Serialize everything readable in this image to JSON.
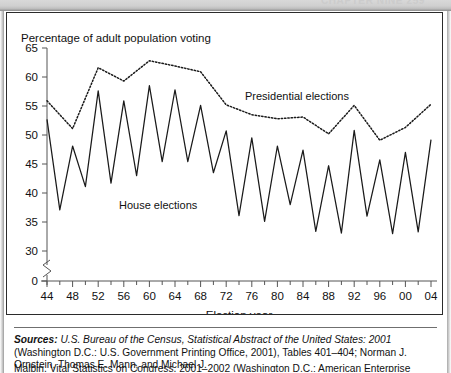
{
  "page": {
    "header_ghost": "CHAPTER NINE 259"
  },
  "figure": {
    "y_axis_title": "Percentage of adult population voting",
    "x_axis_title": "Election year",
    "label_presidential": "Presidential elections",
    "label_house": "House elections"
  },
  "source": {
    "label": "Sources:",
    "line1_italic": "U.S. Bureau of the Census, Statistical Abstract of the United States: 2001",
    "line1_rest": "(Washington D.C.: U.S.",
    "line2": "Government Printing Office, 2001), Tables 401–404; Norman J. Ornstein, Thomas E. Mann, and Michael J.",
    "line3": "Malbin, Vital Statistics on Congress, 2001–2002 (Washington D.C.: American Enterprise Institute, 2002)."
  },
  "chart_data": {
    "type": "line",
    "title": "Percentage of adult population voting",
    "xlabel": "Election year",
    "ylabel": "Percentage of adult population voting",
    "ylim": [
      30,
      65
    ],
    "y_axis_break": true,
    "y_zero_label": "0",
    "yticks": [
      30,
      35,
      40,
      45,
      50,
      55,
      60,
      65
    ],
    "xlim": [
      1944,
      2004
    ],
    "xticks": [
      44,
      48,
      52,
      56,
      60,
      64,
      68,
      72,
      76,
      80,
      84,
      88,
      92,
      96,
      "00",
      "04"
    ],
    "xtick_step_minor": 2,
    "grid": false,
    "legend": "inline-annotations",
    "series": [
      {
        "name": "Presidential elections",
        "style": "dotted",
        "color": "#1a1a1a",
        "x": [
          1944,
          1948,
          1952,
          1956,
          1960,
          1964,
          1968,
          1972,
          1976,
          1980,
          1984,
          1988,
          1992,
          1996,
          2000,
          2004
        ],
        "values": [
          55.9,
          51.1,
          61.6,
          59.3,
          62.8,
          61.9,
          60.9,
          55.2,
          53.5,
          52.8,
          53.1,
          50.2,
          55.1,
          49.1,
          51.3,
          55.3
        ]
      },
      {
        "name": "House elections",
        "style": "solid",
        "color": "#1a1a1a",
        "x": [
          1944,
          1946,
          1948,
          1950,
          1952,
          1954,
          1956,
          1958,
          1960,
          1962,
          1964,
          1966,
          1968,
          1970,
          1972,
          1974,
          1976,
          1978,
          1980,
          1982,
          1984,
          1986,
          1988,
          1990,
          1992,
          1994,
          1996,
          1998,
          2000,
          2002,
          2004
        ],
        "values": [
          52.7,
          37.1,
          48.1,
          41.1,
          57.6,
          41.7,
          55.9,
          43.0,
          58.5,
          45.4,
          57.8,
          45.4,
          55.1,
          43.5,
          50.7,
          36.1,
          49.5,
          35.1,
          48.1,
          38.0,
          47.4,
          33.4,
          44.7,
          33.1,
          50.8,
          36.0,
          45.7,
          33.0,
          47.0,
          33.3,
          49.2
        ]
      }
    ]
  }
}
